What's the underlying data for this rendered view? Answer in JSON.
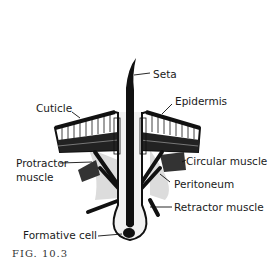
{
  "figure": {
    "caption": "FIG. 10.3",
    "labels": {
      "seta": "Seta",
      "epidermis": "Epidermis",
      "cuticle": "Cuticle",
      "protractor": "Protractor",
      "protractor_line2": "muscle",
      "circular_muscle": "Circular muscle",
      "peritoneum": "Peritoneum",
      "retractor_muscle": "Retractor muscle",
      "formative_cell": "Formative cell"
    },
    "colors": {
      "ink": "#111111",
      "shade": "#d8d8d8",
      "background": "#ffffff"
    }
  }
}
